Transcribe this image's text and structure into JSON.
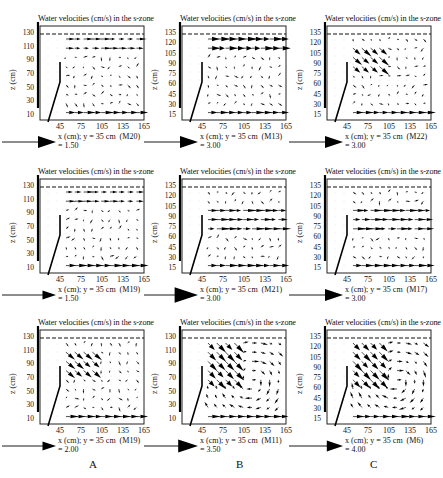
{
  "figure": {
    "column_labels": [
      "A",
      "B",
      "C"
    ]
  },
  "chart_data": [
    {
      "type": "quiver",
      "id": "M20",
      "row": 0,
      "col": 0,
      "title": "Water velocities (cm/s) in the s-zone",
      "xlabel": "x (cm); y = 35 cm",
      "run": "(M20)",
      "ylabel": "z (cm)",
      "xticks": [
        45,
        75,
        105,
        135,
        165
      ],
      "yticks": [
        130,
        110,
        90,
        70,
        50,
        30,
        10
      ],
      "scale_label": "= 1.50",
      "scale_size": 1.0,
      "pattern": "surface-jet"
    },
    {
      "type": "quiver",
      "id": "M13",
      "row": 0,
      "col": 1,
      "title": "Water velocities (cm/s) in the s-zone",
      "xlabel": "x (cm); y = 35 cm",
      "run": "(M13)",
      "ylabel": "z (cm)",
      "xticks": [
        45,
        75,
        105,
        135,
        165
      ],
      "yticks": [
        135,
        120,
        105,
        90,
        75,
        60,
        45,
        30,
        15
      ],
      "scale_label": "= 3.00",
      "scale_size": 1.0,
      "pattern": "strong-surface"
    },
    {
      "type": "quiver",
      "id": "M22",
      "row": 0,
      "col": 2,
      "title": "Water velocities (cm/s) in the s-zone",
      "xlabel": "x (cm); y = 35 cm",
      "run": "(M22)",
      "ylabel": "z (cm)",
      "xticks": [
        45,
        75,
        105,
        135,
        165
      ],
      "yticks": [
        135,
        120,
        105,
        90,
        75,
        60,
        45,
        30,
        15
      ],
      "scale_label": "= 3.00",
      "scale_size": 1.0,
      "pattern": "plunge"
    },
    {
      "type": "quiver",
      "id": "M19a",
      "row": 1,
      "col": 0,
      "title": "Water velocities (cm/s) in the s-zone",
      "xlabel": "x (cm); y = 35 cm",
      "run": "(M19)",
      "ylabel": "z (cm)",
      "xticks": [
        45,
        75,
        105,
        135,
        165
      ],
      "yticks": [
        130,
        110,
        90,
        70,
        50,
        30,
        10
      ],
      "scale_label": "= 1.50",
      "scale_size": 0.75,
      "pattern": "surface-jet"
    },
    {
      "type": "quiver",
      "id": "M21",
      "row": 1,
      "col": 1,
      "title": "Water velocities (cm/s) in the s-zone",
      "xlabel": "x (cm); y = 35 cm",
      "run": "(M21)",
      "ylabel": "z (cm)",
      "xticks": [
        45,
        75,
        105,
        135,
        165
      ],
      "yticks": [
        135,
        120,
        105,
        90,
        75,
        60,
        45,
        30,
        15
      ],
      "scale_label": "= 3.00",
      "scale_size": 1.3,
      "pattern": "mid-jet"
    },
    {
      "type": "quiver",
      "id": "M17",
      "row": 1,
      "col": 2,
      "title": "Water velocities (cm/s) in the s-zone",
      "xlabel": "x (cm); y = 35 cm",
      "run": "(M17)",
      "ylabel": "z (cm)",
      "xticks": [
        45,
        75,
        105,
        135,
        165
      ],
      "yticks": [
        135,
        120,
        105,
        90,
        75,
        60,
        45,
        30,
        15
      ],
      "scale_label": "= 3.00",
      "scale_size": 1.0,
      "pattern": "mid-jet"
    },
    {
      "type": "quiver",
      "id": "M19b",
      "row": 2,
      "col": 0,
      "title": "Water velocities (cm/s) in the s-zone",
      "xlabel": "x (cm); y = 35 cm",
      "run": "(M19)",
      "ylabel": "z (cm)",
      "xticks": [
        45,
        75,
        105,
        135,
        165
      ],
      "yticks": [
        130,
        110,
        90,
        70,
        50,
        30,
        10
      ],
      "scale_label": "= 2.00",
      "scale_size": 0.75,
      "pattern": "plunge"
    },
    {
      "type": "quiver",
      "id": "M11",
      "row": 2,
      "col": 1,
      "title": "Water velocities (cm/s) in the s-zone",
      "xlabel": "x (cm); y = 35 cm",
      "run": "(M11)",
      "ylabel": "z (cm)",
      "xticks": [
        45,
        75,
        105,
        135,
        165
      ],
      "yticks": [
        130,
        110,
        90,
        70,
        50,
        30,
        10
      ],
      "scale_label": "= 3.50",
      "scale_size": 1.1,
      "pattern": "vortex"
    },
    {
      "type": "quiver",
      "id": "M6",
      "row": 2,
      "col": 2,
      "title": "Water velocities (cm/s) in the s-zone",
      "xlabel": "x (cm); y = 35 cm",
      "run": "(M6)",
      "ylabel": "z (cm)",
      "xticks": [
        45,
        75,
        105,
        135,
        165
      ],
      "yticks": [
        135,
        120,
        105,
        90,
        75,
        60,
        45,
        30,
        15
      ],
      "scale_label": "= 4.00",
      "scale_size": 0.9,
      "pattern": "vortex"
    }
  ]
}
